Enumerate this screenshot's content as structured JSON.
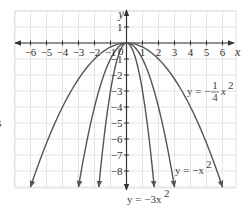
{
  "chart_data": {
    "type": "line",
    "title": "",
    "xlabel": "x",
    "ylabel": "y",
    "xlim": [
      -6.7,
      6.7
    ],
    "ylim": [
      -9.1,
      2.0
    ],
    "grid": true,
    "x_ticks": [
      -6,
      -5,
      -4,
      -3,
      -2,
      -1,
      1,
      2,
      3,
      4,
      5,
      6
    ],
    "x_tick_labels": [
      "−6",
      "−5",
      "−4",
      "−3",
      "−2",
      "−1",
      "1",
      "2",
      "3",
      "4",
      "5",
      "6"
    ],
    "y_ticks": [
      1,
      -1,
      -2,
      -3,
      -4,
      -5,
      -6,
      -7,
      -8
    ],
    "y_tick_labels": [
      "1",
      "−1",
      "−2",
      "−3",
      "−4",
      "−5",
      "−6",
      "−7",
      "−8"
    ],
    "origin_label": "0",
    "series": [
      {
        "name": "y = −1/4 x²",
        "coefficient": -0.25,
        "x_range": [
          -6,
          6
        ],
        "label": {
          "text": "y = −",
          "frac_num": "1",
          "frac_den": "4",
          "tail": "x",
          "exp": "2"
        }
      },
      {
        "name": "y = −x²",
        "coefficient": -1,
        "x_range": [
          -3,
          3
        ],
        "label": {
          "text": "y = −x",
          "exp": "2"
        }
      },
      {
        "name": "y = −3x²",
        "coefficient": -3,
        "x_range": [
          -1.732,
          1.732
        ],
        "label": {
          "text": "y = −3x",
          "exp": "2"
        }
      }
    ],
    "colors": {
      "curve": "#555555",
      "axis": "#333333",
      "grid": "#dddddd"
    }
  },
  "artifacts": {
    "left_edge_glyph": "s"
  }
}
